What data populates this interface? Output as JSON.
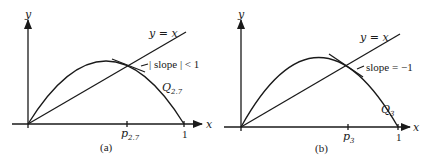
{
  "panels": [
    {
      "caption": "(a)",
      "curve_label": "Q",
      "curve_sub": "2.7",
      "fixed_point_label": "p",
      "fixed_point_sub": "2.7",
      "tangent_annotation": "| slope | < 1",
      "diagonal_label": "y = x",
      "x_axis_label": "x",
      "y_axis_label": "y",
      "x_tick_one": "1"
    },
    {
      "caption": "(b)",
      "curve_label": "Q",
      "curve_sub": "3",
      "fixed_point_label": "p",
      "fixed_point_sub": "3",
      "tangent_annotation": "slope = −1",
      "diagonal_label": "y = x",
      "x_axis_label": "x",
      "y_axis_label": "y",
      "x_tick_one": "1"
    }
  ],
  "colors": {
    "ink": "#1a1a1a",
    "background": "#ffffff"
  }
}
